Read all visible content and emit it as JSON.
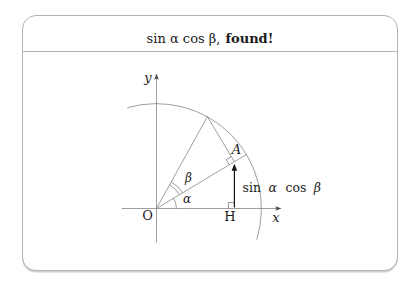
{
  "title": {
    "math": "sin α cos β,",
    "emphasis": "found!"
  },
  "diagram": {
    "axis_labels": {
      "y": "y",
      "x": "x"
    },
    "point_labels": {
      "origin": "O",
      "foot": "H",
      "vertex": "A"
    },
    "angle_labels": {
      "alpha": "α",
      "beta": "β"
    },
    "measure_parts": {
      "fn1": "sin",
      "arg1": "α",
      "fn2": "cos",
      "arg2": "β"
    }
  },
  "colors": {
    "line": "#868686",
    "marker": "#7a7a7a",
    "axis_arrow": "#4a4a4a",
    "highlight_arrow": "#141414",
    "text": "#1c1c1c",
    "frame_border": "#b4b4b4"
  }
}
